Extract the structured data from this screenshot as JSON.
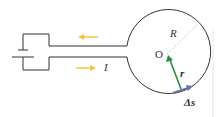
{
  "diagram": {
    "labels": {
      "radius": "R",
      "center": "O",
      "current": "I",
      "position_vector": "r",
      "segment": "Δs"
    },
    "colors": {
      "wire": "#333333",
      "current_arrow": "#f5c542",
      "position_vector": "#2e8b3a",
      "segment_arrow": "#6a6fa8",
      "radius_line": "#bbbbbb"
    }
  }
}
